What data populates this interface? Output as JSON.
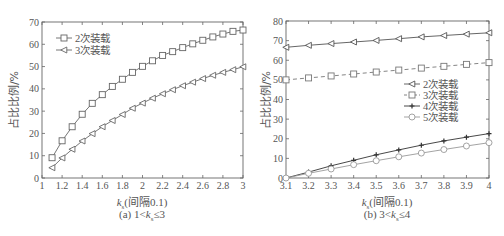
{
  "chart_data": [
    {
      "type": "line",
      "panel": "a",
      "caption": "(a) 1<k_s≤3",
      "caption_parts": {
        "prefix": "(a) 1<",
        "var": "k",
        "sub": "s",
        "suffix": "≤3"
      },
      "xlabel": "k_s(间隔0.1)",
      "xlabel_parts": {
        "var": "k",
        "sub": "s",
        "suffix": "(间隔0.1)"
      },
      "ylabel": "占比比例/%",
      "xlim": [
        1,
        3
      ],
      "ylim": [
        0,
        70
      ],
      "xticks": [
        "1",
        "1.2",
        "1.4",
        "1.6",
        "1.8",
        "2",
        "2.2",
        "2.4",
        "2.6",
        "2.8",
        "3"
      ],
      "yticks": [
        "0",
        "10",
        "20",
        "30",
        "40",
        "50",
        "60",
        "70"
      ],
      "legend_position": "upper left",
      "grid": false,
      "x": [
        1.1,
        1.2,
        1.3,
        1.4,
        1.5,
        1.6,
        1.7,
        1.8,
        1.9,
        2.0,
        2.1,
        2.2,
        2.3,
        2.4,
        2.5,
        2.6,
        2.7,
        2.8,
        2.9,
        3.0
      ],
      "series": [
        {
          "name": "2次装载",
          "marker": "square",
          "dash": false,
          "values": [
            9.1,
            16.7,
            23.0,
            28.6,
            33.5,
            37.4,
            41.1,
            44.3,
            47.4,
            50.1,
            52.6,
            55.0,
            56.7,
            58.5,
            60.2,
            61.8,
            63.3,
            64.6,
            65.8,
            66.4
          ]
        },
        {
          "name": "3次装载",
          "marker": "triangle-left",
          "dash": false,
          "values": [
            4.6,
            9.0,
            12.9,
            16.6,
            19.9,
            23.0,
            25.8,
            28.5,
            31.3,
            33.6,
            35.8,
            37.8,
            39.6,
            41.4,
            43.0,
            44.6,
            46.1,
            47.4,
            48.6,
            49.9
          ]
        }
      ]
    },
    {
      "type": "line",
      "panel": "b",
      "caption": "(b) 3<k_s≤4",
      "caption_parts": {
        "prefix": "(b) 3<",
        "var": "k",
        "sub": "s",
        "suffix": "≤4"
      },
      "xlabel": "k_s(间隔0.1)",
      "xlabel_parts": {
        "var": "k",
        "sub": "s",
        "suffix": "(间隔0.1)"
      },
      "ylabel": "占比比例/%",
      "xlim": [
        3.1,
        4
      ],
      "ylim": [
        0,
        80
      ],
      "xticks": [
        "3.1",
        "3.2",
        "3.3",
        "3.4",
        "3.5",
        "3.6",
        "3.7",
        "3.8",
        "3.9",
        "4"
      ],
      "yticks": [
        "0",
        "10",
        "20",
        "30",
        "40",
        "50",
        "60",
        "70",
        "80"
      ],
      "legend_position": "center right",
      "grid": false,
      "x": [
        3.1,
        3.2,
        3.3,
        3.4,
        3.5,
        3.6,
        3.7,
        3.8,
        3.9,
        4.0
      ],
      "series": [
        {
          "name": "2次装载",
          "marker": "triangle-left",
          "dash": false,
          "color": "#555555",
          "values": [
            66.6,
            67.6,
            68.5,
            69.3,
            70.1,
            71.0,
            71.9,
            72.6,
            73.3,
            74.0
          ]
        },
        {
          "name": "3次装载",
          "marker": "square",
          "dash": true,
          "color": "#777777",
          "values": [
            50.0,
            51.0,
            52.0,
            53.0,
            54.0,
            55.0,
            56.0,
            56.9,
            57.9,
            58.8
          ]
        },
        {
          "name": "4次装载",
          "marker": "star",
          "dash": false,
          "color": "#333333",
          "values": [
            0.0,
            3.0,
            6.2,
            9.0,
            11.8,
            14.3,
            16.7,
            18.9,
            20.8,
            22.6
          ]
        },
        {
          "name": "5次装载",
          "marker": "circle",
          "dash": false,
          "color": "#999999",
          "values": [
            0.0,
            2.4,
            4.6,
            6.8,
            8.8,
            10.8,
            12.7,
            14.5,
            16.3,
            18.0
          ]
        }
      ]
    }
  ]
}
